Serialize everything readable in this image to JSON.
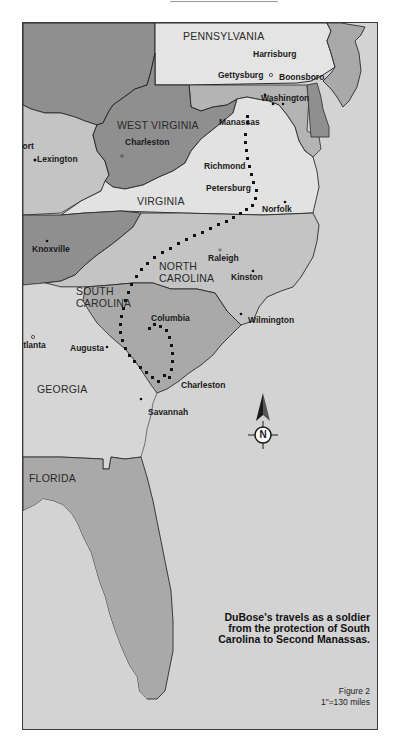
{
  "map": {
    "title_caption": [
      "DuBose's travels as a soldier",
      "from the protection of South",
      "Carolina to Second Manassas."
    ],
    "figure_label": "Figure 2",
    "scale": "1\"=130 miles",
    "compass": {
      "letter": "N"
    },
    "colors": {
      "background_ocean": "#d3d3d3",
      "state_dark": "#8f8f8f",
      "state_mid": "#a9a9a9",
      "state_light": "#c4c4c4",
      "state_pale": "#e2e2e2",
      "route_dots": "#111111",
      "border": "#2a2a2a"
    },
    "states": [
      {
        "name": "PENNSYLVANIA"
      },
      {
        "name": "WEST VIRGINIA"
      },
      {
        "name": "VIRGINIA"
      },
      {
        "name": "NORTH CAROLINA",
        "line1": "NORTH",
        "line2": "CAROLINA"
      },
      {
        "name": "SOUTH CAROLINA",
        "line1": "SOUTH",
        "line2": "CAROLINA"
      },
      {
        "name": "GEORGIA"
      },
      {
        "name": "FLORIDA"
      }
    ],
    "cities": [
      {
        "name": "Harrisburg"
      },
      {
        "name": "Gettysburg"
      },
      {
        "name": "Boonsboro"
      },
      {
        "name": "Washington"
      },
      {
        "name": "Manassas"
      },
      {
        "name": "Charleston",
        "state": "WV"
      },
      {
        "name": "kfort"
      },
      {
        "name": "Lexington"
      },
      {
        "name": "Richmond"
      },
      {
        "name": "Petersburg"
      },
      {
        "name": "Norfolk"
      },
      {
        "name": "Knoxville"
      },
      {
        "name": "Raleigh"
      },
      {
        "name": "Kinston"
      },
      {
        "name": "Wilmington"
      },
      {
        "name": "Columbia"
      },
      {
        "name": "Atlanta"
      },
      {
        "name": "Augusta"
      },
      {
        "name": "Charleston",
        "state": "SC"
      },
      {
        "name": "Savannah"
      }
    ]
  }
}
